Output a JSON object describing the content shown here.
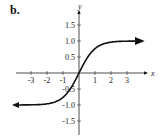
{
  "panel_label": "b.",
  "chart_data": {
    "type": "line",
    "title": "",
    "xlabel": "x",
    "ylabel": "y",
    "xlim": [
      -4,
      4
    ],
    "ylim": [
      -1.8,
      1.8
    ],
    "x_ticks": [
      -3,
      -2,
      -1,
      1,
      2,
      3
    ],
    "x_tick_labels": [
      "-3",
      "-2",
      "-1",
      "1",
      "2",
      "3"
    ],
    "y_ticks": [
      1.5,
      1.0,
      0.5,
      -0.5,
      -1.0,
      -1.5
    ],
    "y_tick_labels": [
      "1.5",
      "1.0",
      "0.5",
      "-0.5",
      "-1.0",
      "-1.5"
    ],
    "grid": false,
    "legend": null,
    "series": [
      {
        "name": "f(x)",
        "description": "odd sigmoid-shaped curve through origin, horizontal asymptotes y=1 and y=-1, arrows on both ends",
        "x": [
          -4,
          -3,
          -2,
          -1.5,
          -1,
          -0.5,
          0,
          0.5,
          1,
          1.5,
          2,
          3,
          4
        ],
        "y": [
          -1.0,
          -0.99,
          -0.96,
          -0.9,
          -0.76,
          -0.46,
          0,
          0.46,
          0.76,
          0.9,
          0.96,
          0.99,
          1.0
        ]
      }
    ]
  }
}
